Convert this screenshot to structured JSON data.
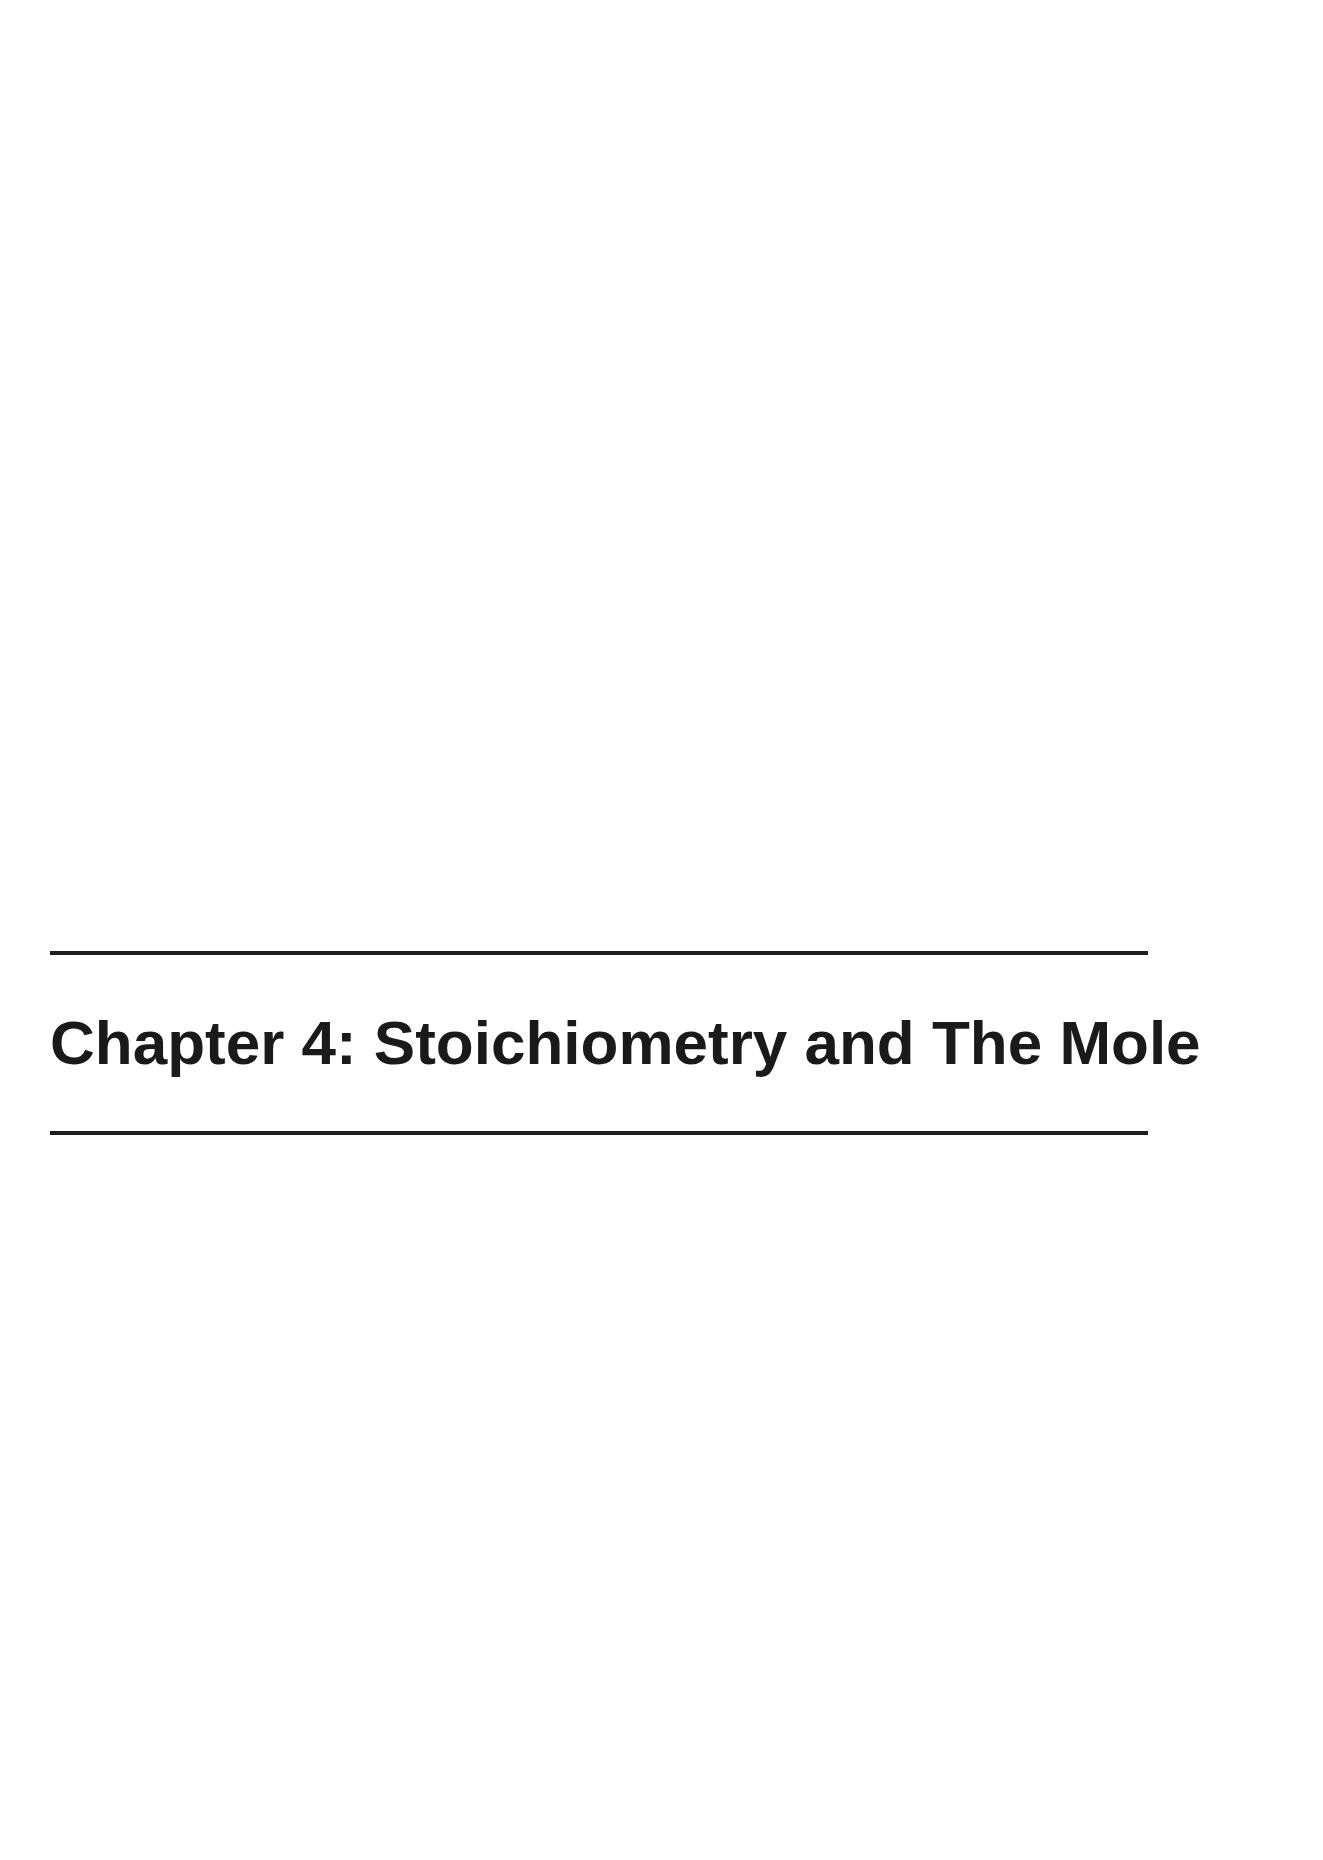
{
  "page": {
    "background_color": "#ffffff",
    "rule_color": "#1e1e1e",
    "text_color": "#1a1a1a"
  },
  "chapter": {
    "title": "Chapter 4: Stoichiometry and The Mole"
  }
}
